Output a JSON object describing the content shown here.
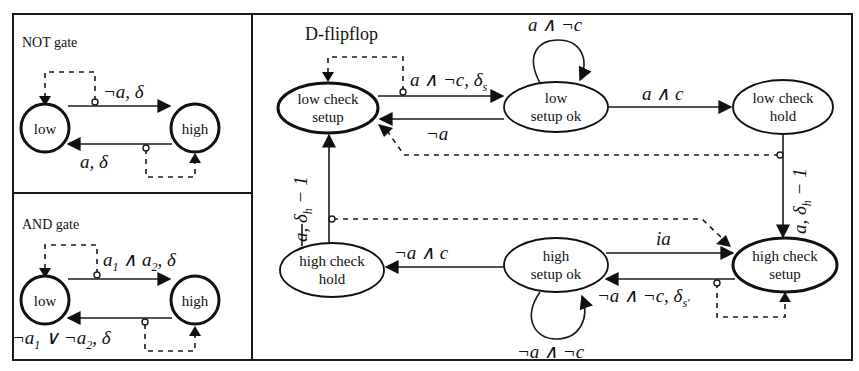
{
  "panels": {
    "not_gate": {
      "title": "NOT gate",
      "nodes": {
        "low": "low",
        "high": "high"
      },
      "edges": {
        "low_to_high": "¬a, δ",
        "high_to_low": "a, δ"
      }
    },
    "and_gate": {
      "title": "AND gate",
      "nodes": {
        "low": "low",
        "high": "high"
      },
      "edges": {
        "low_to_high": {
          "a": "a",
          "s1": "1",
          "and": " ∧ ",
          "a2": "a",
          "s2": "2",
          "delta": ", δ"
        },
        "high_to_low": {
          "neg1": "¬a",
          "s1": "1",
          "or": " ∨ ¬a",
          "s2": "2",
          "delta": ", δ"
        }
      }
    },
    "d_flipflop": {
      "title": "D-flipflop",
      "nodes": {
        "low_check_setup": [
          "low check",
          "setup"
        ],
        "low_setup_ok": [
          "low",
          "setup ok"
        ],
        "low_check_hold": [
          "low check",
          "hold"
        ],
        "high_check_setup": [
          "high check",
          "setup"
        ],
        "high_setup_ok": [
          "high",
          "setup ok"
        ],
        "high_check_hold": [
          "high check",
          "hold"
        ]
      },
      "edges": {
        "lcs_to_lso": {
          "main": "a ∧ ¬c, δ",
          "sub": "s"
        },
        "lso_to_lcs": "¬a",
        "lso_self": "a ∧ ¬c",
        "lso_to_lch": "a ∧ c",
        "lch_to_hcs": {
          "main": "a, δ",
          "sub": "h",
          "tail": " − 1"
        },
        "hso_to_hcs": "ia",
        "hcs_to_hso": {
          "main": "¬a ∧ ¬c, δ",
          "sub": "s'"
        },
        "hso_self": "¬a ∧ ¬c",
        "hso_to_hch": "¬a ∧ c",
        "hch_to_lcs": {
          "main": "a, δ",
          "sub": "h",
          "tail": " − 1"
        }
      }
    }
  },
  "colors": {
    "ink": "#111111",
    "background": "#ffffff"
  }
}
